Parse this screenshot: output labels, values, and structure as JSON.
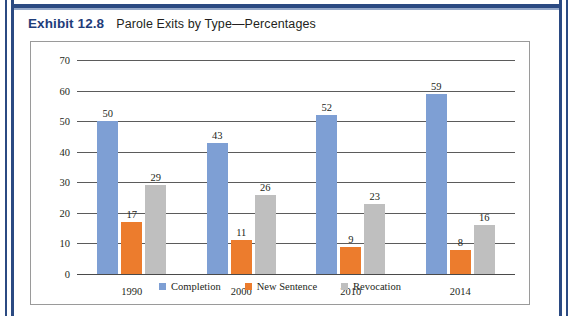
{
  "caption": {
    "exhibit_label": "Exhibit 12.8",
    "exhibit_title": "Parole Exits by Type—Percentages"
  },
  "colors": {
    "frame_blue": "#2b4a82",
    "exhibit_label_blue": "#1f3d7a",
    "completion": "#7e9fd4",
    "new_sentence": "#ec7c2d",
    "revocation": "#bfbfbf",
    "gridline": "#5b5b5b",
    "plot_border": "#9a9a9a",
    "text": "#231f20"
  },
  "chart_data": {
    "type": "bar",
    "title": "Parole Exits by Type—Percentages",
    "xlabel": "",
    "ylabel": "",
    "categories": [
      "1990",
      "2000",
      "2010",
      "2014"
    ],
    "series": [
      {
        "name": "Completion",
        "color": "#7e9fd4",
        "values": [
          50,
          43,
          52,
          59
        ]
      },
      {
        "name": "New Sentence",
        "color": "#ec7c2d",
        "values": [
          17,
          11,
          9,
          8
        ]
      },
      {
        "name": "Revocation",
        "color": "#bfbfbf",
        "values": [
          29,
          26,
          23,
          16
        ]
      }
    ],
    "ylim": [
      0,
      70
    ],
    "yticks": [
      70,
      60,
      50,
      40,
      30,
      20,
      10,
      0
    ],
    "grid": true,
    "data_labels": true,
    "legend_position": "bottom"
  }
}
